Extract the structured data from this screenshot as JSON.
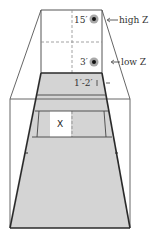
{
  "diagram": {
    "colors": {
      "floor": "#d4d4d4",
      "line": "#2a2a2a",
      "thin_line": "#555555",
      "dash": "#8a8a8a",
      "target_ring": "#a8a8a8",
      "target_center": "#111111",
      "highlight_box": "#ffffff"
    },
    "targets": [
      {
        "height_label": "15′",
        "zone_label": "high Z"
      },
      {
        "height_label": "3′",
        "zone_label": "low Z"
      }
    ],
    "floor_marker_label": "1′-2′",
    "position_marker": "X"
  }
}
